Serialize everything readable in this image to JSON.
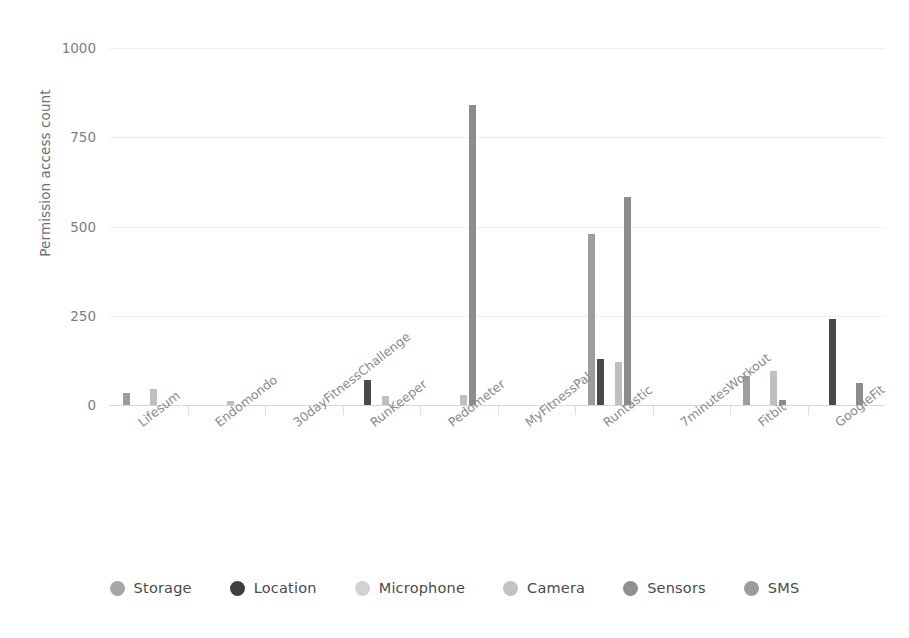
{
  "chart_data": {
    "type": "bar",
    "title": "",
    "xlabel": "",
    "ylabel": "Permission access count",
    "ylim": [
      0,
      1000
    ],
    "yticks": [
      0,
      250,
      500,
      750,
      1000
    ],
    "ytick_labels": [
      "0",
      "250",
      "500",
      "750",
      "1000"
    ],
    "grid": true,
    "legend_position": "bottom",
    "categories": [
      "Lifesum",
      "Endomondo",
      "30dayFitnessChallenge",
      "RunKeeper",
      "Pedometer",
      "MyFitnessPal",
      "Runtastic",
      "7minutesWorkout",
      "Fitbit",
      "GoogleFit"
    ],
    "series": [
      {
        "name": "Storage",
        "color": "#9d9d9d",
        "values": [
          35,
          0,
          0,
          0,
          0,
          0,
          480,
          0,
          82,
          0
        ]
      },
      {
        "name": "Location",
        "color": "#4a4a4a",
        "values": [
          0,
          0,
          0,
          70,
          0,
          0,
          130,
          0,
          0,
          240
        ]
      },
      {
        "name": "Microphone",
        "color": "#cfcfcf",
        "values": [
          0,
          0,
          0,
          0,
          0,
          0,
          0,
          0,
          0,
          0
        ]
      },
      {
        "name": "Camera",
        "color": "#bfbfbf",
        "values": [
          45,
          10,
          0,
          25,
          28,
          0,
          120,
          0,
          95,
          0
        ]
      },
      {
        "name": "Sensors",
        "color": "#8c8c8c",
        "values": [
          0,
          0,
          0,
          0,
          840,
          0,
          583,
          0,
          14,
          62
        ]
      },
      {
        "name": "SMS",
        "color": "#989898",
        "values": [
          0,
          0,
          0,
          0,
          0,
          0,
          0,
          0,
          0,
          0
        ]
      }
    ]
  },
  "legend": {
    "items": [
      {
        "label": "Storage",
        "color": "#a6a6a6"
      },
      {
        "label": "Location",
        "color": "#3f3f3f"
      },
      {
        "label": "Microphone",
        "color": "#d2d2d2"
      },
      {
        "label": "Camera",
        "color": "#c2c2c2"
      },
      {
        "label": "Sensors",
        "color": "#8f8f8f"
      },
      {
        "label": "SMS",
        "color": "#9b9b9b"
      }
    ]
  }
}
